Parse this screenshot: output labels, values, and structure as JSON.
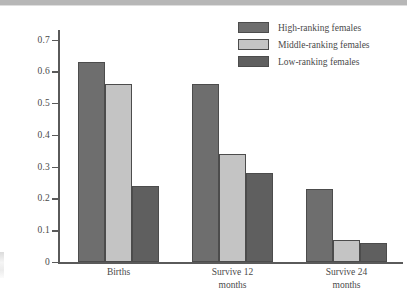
{
  "chart_data": {
    "type": "bar",
    "title": "",
    "xlabel": "",
    "ylabel": "Events per year",
    "ylim": [
      0,
      0.73
    ],
    "yticks": [
      0,
      0.1,
      0.2,
      0.3,
      0.4,
      0.5,
      0.6,
      0.7
    ],
    "ytick_labels": [
      "0",
      "0.1",
      "0.2",
      "0.3",
      "0.4",
      "0.5",
      "0.6",
      "0.7"
    ],
    "grid": false,
    "legend_position": "top-right",
    "categories": [
      "Births",
      "Survive 12\nmonths",
      "Survive 24\nmonths"
    ],
    "series": [
      {
        "name": "High-ranking females",
        "color": "#6e6e6e",
        "values": [
          0.63,
          0.56,
          0.23
        ]
      },
      {
        "name": "Middle-ranking females",
        "color": "#c4c4c4",
        "values": [
          0.56,
          0.34,
          0.07
        ]
      },
      {
        "name": "Low-ranking females",
        "color": "#5f5f5f",
        "values": [
          0.24,
          0.28,
          0.06
        ]
      }
    ]
  },
  "legend": {
    "items": [
      {
        "label": "High-ranking females"
      },
      {
        "label": "Middle-ranking females"
      },
      {
        "label": "Low-ranking females"
      }
    ]
  },
  "axes": {
    "y_title": "Events per year"
  }
}
